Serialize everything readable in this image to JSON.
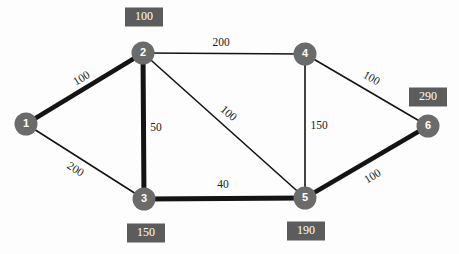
{
  "diagram": {
    "type": "node-link-graph",
    "canvas": {
      "width": 459,
      "height": 254
    },
    "colors": {
      "node_fill": "#6b6b6b",
      "node_text": "#ffffff",
      "edge_stroke": "#141414",
      "badge_fill": "#5c5c5c",
      "badge_text": "#ffffff",
      "background": "#fdfdfd"
    },
    "nodes": [
      {
        "id": "1",
        "label": "1",
        "cx": 26,
        "cy": 124,
        "r": 11.5,
        "badge": null
      },
      {
        "id": "2",
        "label": "2",
        "cx": 143,
        "cy": 53,
        "r": 11.5,
        "badge": {
          "value": "100",
          "x": 144,
          "y": 17,
          "w": 38,
          "h": 19
        }
      },
      {
        "id": "3",
        "label": "3",
        "cx": 144,
        "cy": 199,
        "r": 11.5,
        "badge": {
          "value": "150",
          "x": 146,
          "y": 233,
          "w": 38,
          "h": 19
        }
      },
      {
        "id": "4",
        "label": "4",
        "cx": 305,
        "cy": 54,
        "r": 11.5,
        "badge": null
      },
      {
        "id": "5",
        "label": "5",
        "cx": 305,
        "cy": 198,
        "r": 11.5,
        "badge": {
          "value": "190",
          "x": 306,
          "y": 231,
          "w": 38,
          "h": 19
        }
      },
      {
        "id": "6",
        "label": "6",
        "cx": 428,
        "cy": 126,
        "r": 11.5,
        "badge": {
          "value": "290",
          "x": 428,
          "y": 97,
          "w": 38,
          "h": 19
        }
      }
    ],
    "edges": [
      {
        "id": "e-1-2",
        "source": "1",
        "target": "2",
        "weight": "100",
        "thick": true,
        "stroke_width": 4.5,
        "label_x": 82,
        "label_y": 79,
        "label_rotate": -31
      },
      {
        "id": "e-1-3",
        "source": "1",
        "target": "3",
        "weight": "200",
        "thick": false,
        "stroke_width": 1.6,
        "label_x": 75,
        "label_y": 170,
        "label_rotate": 33
      },
      {
        "id": "e-2-3",
        "source": "2",
        "target": "3",
        "weight": "50",
        "thick": true,
        "stroke_width": 5.0,
        "label_x": 156,
        "label_y": 128,
        "label_rotate": 0
      },
      {
        "id": "e-2-4",
        "source": "2",
        "target": "4",
        "weight": "200",
        "thick": false,
        "stroke_width": 1.6,
        "label_x": 221,
        "label_y": 43,
        "label_rotate": 0
      },
      {
        "id": "e-2-5",
        "source": "2",
        "target": "5",
        "weight": "100",
        "thick": false,
        "stroke_width": 1.6,
        "label_x": 228,
        "label_y": 114,
        "label_rotate": 40
      },
      {
        "id": "e-4-5",
        "source": "4",
        "target": "5",
        "weight": "150",
        "thick": false,
        "stroke_width": 1.6,
        "label_x": 319,
        "label_y": 126,
        "label_rotate": 0
      },
      {
        "id": "e-4-6",
        "source": "4",
        "target": "6",
        "weight": "100",
        "thick": false,
        "stroke_width": 1.6,
        "label_x": 371,
        "label_y": 79,
        "label_rotate": 30
      },
      {
        "id": "e-3-5",
        "source": "3",
        "target": "5",
        "weight": "40",
        "thick": true,
        "stroke_width": 5.0,
        "label_x": 223,
        "label_y": 185,
        "label_rotate": 0
      },
      {
        "id": "e-5-6",
        "source": "5",
        "target": "6",
        "weight": "100",
        "thick": true,
        "stroke_width": 4.5,
        "label_x": 373,
        "label_y": 177,
        "label_rotate": -31
      }
    ]
  }
}
